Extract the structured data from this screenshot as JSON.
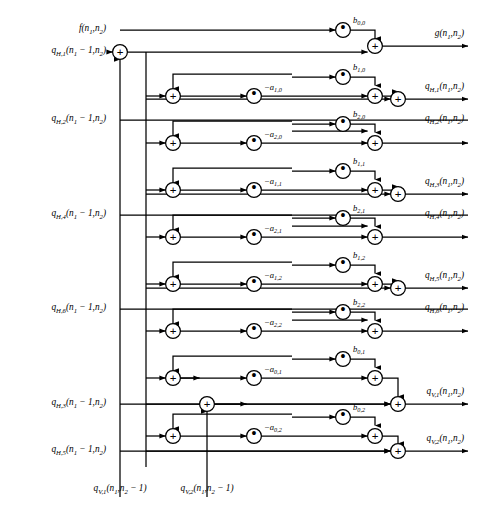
{
  "diagram": {
    "type": "signal-flow-graph",
    "background": "#ffffff",
    "line_color": "#000000",
    "geometry": {
      "width": 482,
      "height": 505,
      "col_adder_left": 173,
      "col_mult_a": 254,
      "col_bus": 292,
      "col_mult_b": 343,
      "col_adder_right": 375,
      "col_adder_out": 398,
      "col_input_adder": 120,
      "col_feedback_bus": 146,
      "col_qv1_bus": 120,
      "col_qv2_bus": 207,
      "row_f": 30,
      "row_top_adder": 52,
      "row_spacing": 47
    },
    "inputs": [
      {
        "name": "f-input",
        "y": 30,
        "html": "f(n<sub>1</sub>,n<sub>2</sub>)"
      },
      {
        "name": "qh1-delay-input",
        "y": 52,
        "html": "q<sub>H,1</sub>(n<sub>1</sub> &minus; 1,n<sub>2</sub>)"
      },
      {
        "name": "qh2-delay-input",
        "y": 120,
        "html": "q<sub>H,2</sub>(n<sub>1</sub> &minus; 1,n<sub>2</sub>)"
      },
      {
        "name": "qh4-delay-input",
        "y": 215,
        "html": "q<sub>H,4</sub>(n<sub>1</sub> &minus; 1,n<sub>2</sub>)"
      },
      {
        "name": "qh6-delay-input",
        "y": 309,
        "html": "q<sub>H,6</sub>(n<sub>1</sub> &minus; 1,n<sub>2</sub>)"
      },
      {
        "name": "qh3-delay-input",
        "y": 404,
        "html": "q<sub>H,3</sub>(n<sub>1</sub> &minus; 1,n<sub>2</sub>)"
      },
      {
        "name": "qh5-delay-input",
        "y": 451,
        "html": "q<sub>H,5</sub>(n<sub>1</sub> &minus; 1,n<sub>2</sub>)"
      }
    ],
    "bottom_inputs": [
      {
        "name": "qv1-delay-input",
        "x": 120,
        "y": 478,
        "html": "q<sub>V,1</sub>(n<sub>1</sub>,n<sub>2</sub> &minus; 1)"
      },
      {
        "name": "qv2-delay-input",
        "x": 207,
        "y": 478,
        "html": "q<sub>V,2</sub>(n<sub>1</sub>,n<sub>2</sub> &minus; 1)"
      }
    ],
    "outputs": [
      {
        "name": "g-output",
        "y": 46,
        "html": "g(n<sub>1</sub>,n<sub>2</sub>)"
      },
      {
        "name": "qh1-output",
        "y": 99,
        "html": "q<sub>H,1</sub>(n<sub>1</sub>,n<sub>2</sub>)"
      },
      {
        "name": "qh2-output",
        "y": 131,
        "html": "q<sub>H,2</sub>(n<sub>1</sub>,n<sub>2</sub>)"
      },
      {
        "name": "qh3-output",
        "y": 194,
        "html": "q<sub>H,3</sub>(n<sub>1</sub>,n<sub>2</sub>)"
      },
      {
        "name": "qh4-output",
        "y": 226,
        "html": "q<sub>H,4</sub>(n<sub>1</sub>,n<sub>2</sub>)"
      },
      {
        "name": "qh5-output",
        "y": 288,
        "html": "q<sub>H,5</sub>(n<sub>1</sub>,n<sub>2</sub>)"
      },
      {
        "name": "qh6-output",
        "y": 320,
        "html": "q<sub>H,6</sub>(n<sub>1</sub>,n<sub>2</sub>)"
      },
      {
        "name": "qv1-output",
        "y": 404,
        "html": "q<sub>V,1</sub>(n<sub>1</sub>,n<sub>2</sub>)"
      },
      {
        "name": "qv2-output",
        "y": 451,
        "html": "q<sub>V,2</sub>(n<sub>1</sub>,n<sub>2</sub>)"
      }
    ],
    "feedback_coefficients": [
      {
        "name": "coef-a-1-0",
        "y": 96,
        "html": "&minus;a<sub>1,0</sub>"
      },
      {
        "name": "coef-a-2-0",
        "y": 143,
        "html": "&minus;a<sub>2,0</sub>"
      },
      {
        "name": "coef-a-1-1",
        "y": 190,
        "html": "&minus;a<sub>1,1</sub>"
      },
      {
        "name": "coef-a-2-1",
        "y": 237,
        "html": "&minus;a<sub>2,1</sub>"
      },
      {
        "name": "coef-a-1-2",
        "y": 284,
        "html": "&minus;a<sub>1,2</sub>"
      },
      {
        "name": "coef-a-2-2",
        "y": 331,
        "html": "&minus;a<sub>2,2</sub>"
      },
      {
        "name": "coef-a-0-1",
        "y": 378,
        "html": "&minus;a<sub>0,1</sub>"
      },
      {
        "name": "coef-a-0-2",
        "y": 436,
        "html": "&minus;a<sub>0,2</sub>"
      }
    ],
    "feedforward_coefficients": [
      {
        "name": "coef-b-0-0",
        "y": 30,
        "html": "b<sub>0,0</sub>"
      },
      {
        "name": "coef-b-1-0",
        "y": 77,
        "html": "b<sub>1,0</sub>"
      },
      {
        "name": "coef-b-2-0",
        "y": 124,
        "html": "b<sub>2,0</sub>"
      },
      {
        "name": "coef-b-1-1",
        "y": 171,
        "html": "b<sub>1,1</sub>"
      },
      {
        "name": "coef-b-2-1",
        "y": 218,
        "html": "b<sub>2,1</sub>"
      },
      {
        "name": "coef-b-1-2",
        "y": 265,
        "html": "b<sub>1,2</sub>"
      },
      {
        "name": "coef-b-2-2",
        "y": 312,
        "html": "b<sub>2,2</sub>"
      },
      {
        "name": "coef-b-0-1",
        "y": 359,
        "html": "b<sub>0,1</sub>"
      },
      {
        "name": "coef-b-0-2",
        "y": 417,
        "html": "b<sub>0,2</sub>"
      }
    ],
    "node_glyphs": {
      "adder": "+",
      "multiplier": "•"
    }
  }
}
